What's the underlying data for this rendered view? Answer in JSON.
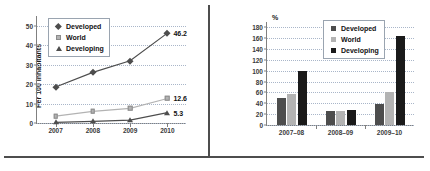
{
  "figure": {
    "panels": [
      "line-chart",
      "bar-chart"
    ],
    "divider": "vertical-rule",
    "footer_rule": "horizontal-rule"
  },
  "colors": {
    "developed": "#4d4d4d",
    "world": "#b3b3b3",
    "developing": "#1a1a1a",
    "grid": "#a9b6c9",
    "axis": "#808080",
    "rule": "#4d4d4d"
  },
  "chart_data": [
    {
      "type": "line",
      "title": "",
      "xlabel": "",
      "ylabel": "Per 100 inhabitants",
      "x": [
        "2007",
        "2008",
        "2009",
        "2010"
      ],
      "ylim": [
        0,
        55
      ],
      "yticks": [
        0,
        10,
        20,
        30,
        40,
        50
      ],
      "ytick_labels": [
        "0",
        "10",
        "20",
        "30",
        "40",
        "50"
      ],
      "grid": true,
      "legend_position": "top-left",
      "series": [
        {
          "name": "Developed",
          "marker": "diamond",
          "color": "#4d4d4d",
          "values": [
            18.5,
            26.0,
            32.0,
            46.2
          ],
          "end_label": "46.2"
        },
        {
          "name": "World",
          "marker": "square",
          "color": "#b3b3b3",
          "values": [
            3.5,
            6.0,
            7.5,
            12.6
          ],
          "end_label": "12.6"
        },
        {
          "name": "Developing",
          "marker": "triangle",
          "color": "#4d4d4d",
          "values": [
            0.3,
            0.8,
            1.5,
            5.3
          ],
          "end_label": "5.3"
        }
      ]
    },
    {
      "type": "bar",
      "title": "",
      "xlabel": "",
      "ylabel": "%",
      "categories": [
        "2007–08",
        "2008–09",
        "2009–10"
      ],
      "ylim": [
        0,
        190
      ],
      "yticks": [
        0,
        20,
        40,
        60,
        80,
        100,
        120,
        140,
        160,
        180
      ],
      "ytick_labels": [
        "0",
        "20",
        "40",
        "60",
        "80",
        "100",
        "120",
        "140",
        "160",
        "180"
      ],
      "grid": true,
      "legend_position": "top-center",
      "series": [
        {
          "name": "Developed",
          "color": "#4d4d4d",
          "values": [
            50,
            25,
            38
          ]
        },
        {
          "name": "World",
          "color": "#b3b3b3",
          "values": [
            57,
            25,
            61
          ]
        },
        {
          "name": "Developing",
          "color": "#1a1a1a",
          "values": [
            100,
            27,
            164
          ]
        }
      ]
    }
  ]
}
